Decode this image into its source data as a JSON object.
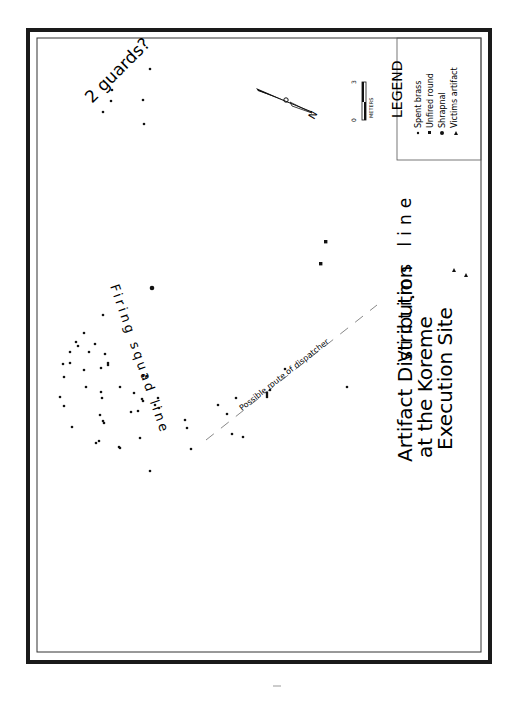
{
  "map": {
    "title_line1": "Artifact Distribution",
    "title_line2": "at the Koreme",
    "title_line3": "Execution Site",
    "labels": {
      "guards": "2 guards?",
      "firing_squad": "Firing squad line",
      "victims": "Victims line",
      "dispatcher": "Possible route of dispatcher"
    },
    "legend": {
      "title": "LEGEND",
      "items": [
        {
          "symbol": "spent-brass-dot",
          "label": "Spent brass"
        },
        {
          "symbol": "unfired-round-square",
          "label": "Unfired round"
        },
        {
          "symbol": "shrapnal-circle",
          "label": "Shrapnal"
        },
        {
          "symbol": "victims-artifact-triangle",
          "label": "Victims artifact"
        }
      ]
    },
    "scale": {
      "start": "0",
      "end": "3",
      "unit": "METERS"
    },
    "north_arrow": {
      "label": "N"
    },
    "colors": {
      "ink": "#111111",
      "frame": "#1a1a1a",
      "route": "#888888",
      "paper": "#ffffff"
    }
  }
}
